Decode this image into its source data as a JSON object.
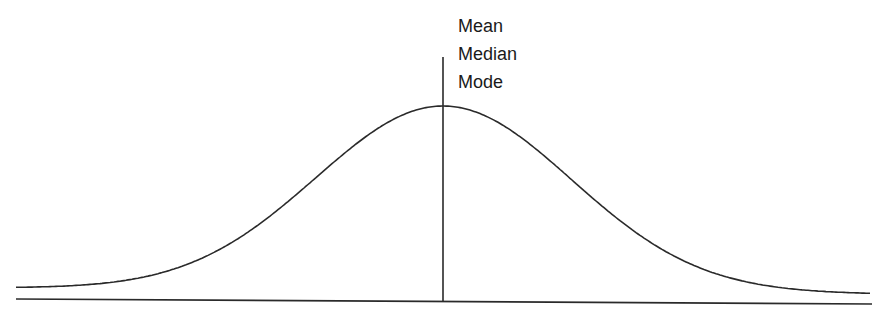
{
  "diagram": {
    "center_labels": [
      "Mean",
      "Median",
      "Mode"
    ],
    "line_color": "#2a2a2a"
  },
  "chart_data": {
    "type": "line",
    "title": "",
    "xlabel": "",
    "ylabel": "",
    "distribution": "normal",
    "annotations": [
      "Mean",
      "Median",
      "Mode"
    ],
    "annotation_position": "center",
    "grid": false
  }
}
